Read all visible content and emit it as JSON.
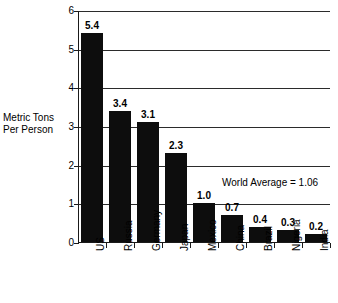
{
  "chart_data": {
    "type": "bar",
    "title": "",
    "subtitle": "",
    "xlabel": "",
    "ylabel": "Metric Tons Per Person",
    "ylabel_lines": [
      "Metric Tons",
      "Per Person"
    ],
    "ylim": [
      0,
      6
    ],
    "yticks": [
      0,
      1,
      2,
      3,
      4,
      5,
      6
    ],
    "ytick_labels": [
      "0",
      "1",
      "2",
      "3",
      "4",
      "5",
      "6"
    ],
    "grid": "horizontal",
    "legend": "none",
    "bar_color": "#0d0d0d",
    "categories": [
      "US",
      "Russia",
      "Germany",
      "Japan",
      "Mexico",
      "China",
      "Brazil",
      "Nigeria",
      "India"
    ],
    "values": [
      5.4,
      3.4,
      3.1,
      2.3,
      1.0,
      0.7,
      0.4,
      0.3,
      0.2
    ],
    "value_labels": [
      "5.4",
      "3.4",
      "3.1",
      "2.3",
      "1.0",
      "0.7",
      "0.4",
      "0.3",
      "0.2"
    ],
    "annotations": [
      {
        "text": "World Average = 1.06",
        "value": 1.06
      }
    ]
  }
}
